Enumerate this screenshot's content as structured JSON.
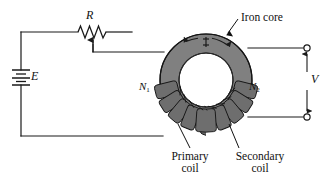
{
  "figure": {
    "colors": {
      "wire": "#1a1a1a",
      "core_fill": "#7d7d7d",
      "core_outline": "#111111",
      "coil_fill": "#6b6b6b",
      "background": "#ffffff",
      "text": "#111111"
    }
  },
  "labels": {
    "resistor": "R",
    "emf": "E",
    "voltage": "V",
    "primary_turns": "N",
    "primary_turns_sub": "1",
    "secondary_turns": "N",
    "secondary_turns_sub": "2",
    "iron_core": "Iron core",
    "primary_coil_line1": "Primary",
    "primary_coil_line2": "coil",
    "secondary_coil_line1": "Secondary",
    "secondary_coil_line2": "coil"
  },
  "components": {
    "battery": {
      "name": "battery",
      "symbol": "multi-cell-battery",
      "label": "E",
      "x": 21,
      "y": 77
    },
    "resistor": {
      "name": "rheostat",
      "symbol": "zigzag-resistor-with-tap",
      "label": "R",
      "x": 92,
      "y": 32
    },
    "core": {
      "name": "toroidal-iron-core",
      "center_x": 206,
      "center_y": 80,
      "outer_radius": 46,
      "inner_radius": 27,
      "flux_direction": "clockwise"
    },
    "primary_winding": {
      "name": "primary-coil",
      "turns_label": "N1",
      "side": "left",
      "turn_count": 9
    },
    "secondary_winding": {
      "name": "secondary-coil",
      "turns_label": "N2",
      "side": "right",
      "turn_count": 9
    },
    "terminals": {
      "top": {
        "x": 307,
        "y": 48
      },
      "bottom": {
        "x": 307,
        "y": 117
      }
    }
  }
}
